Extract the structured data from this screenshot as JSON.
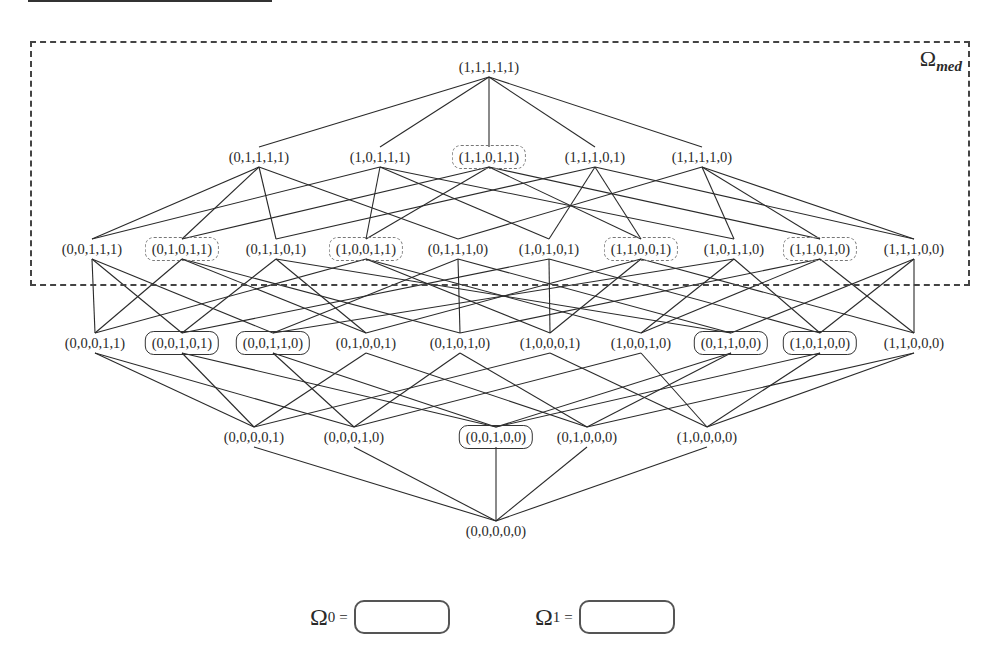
{
  "region_label": {
    "symbol": "Ω",
    "subscript": "med"
  },
  "levels": [
    {
      "y": 531,
      "nodes": [
        {
          "label": "(0,0,0,0,0)",
          "x": 496,
          "style": "plain"
        }
      ]
    },
    {
      "y": 437,
      "nodes": [
        {
          "label": "(0,0,0,0,1)",
          "x": 254,
          "style": "plain"
        },
        {
          "label": "(0,0,0,1,0)",
          "x": 354,
          "style": "plain"
        },
        {
          "label": "(0,0,1,0,0)",
          "x": 496,
          "style": "solid"
        },
        {
          "label": "(0,1,0,0,0)",
          "x": 587,
          "style": "plain"
        },
        {
          "label": "(1,0,0,0,0)",
          "x": 707,
          "style": "plain"
        }
      ]
    },
    {
      "y": 343,
      "nodes": [
        {
          "label": "(0,0,0,1,1)",
          "x": 95,
          "style": "plain"
        },
        {
          "label": "(0,0,1,0,1)",
          "x": 182,
          "style": "solid"
        },
        {
          "label": "(0,0,1,1,0)",
          "x": 273,
          "style": "solid"
        },
        {
          "label": "(0,1,0,0,1)",
          "x": 366,
          "style": "plain"
        },
        {
          "label": "(0,1,0,1,0)",
          "x": 460,
          "style": "plain"
        },
        {
          "label": "(1,0,0,0,1)",
          "x": 550,
          "style": "plain"
        },
        {
          "label": "(1,0,0,1,0)",
          "x": 641,
          "style": "plain"
        },
        {
          "label": "(0,1,1,0,0)",
          "x": 731,
          "style": "solid"
        },
        {
          "label": "(1,0,1,0,0)",
          "x": 820,
          "style": "solid"
        },
        {
          "label": "(1,1,0,0,0)",
          "x": 914,
          "style": "plain"
        }
      ]
    },
    {
      "y": 249,
      "nodes": [
        {
          "label": "(0,0,1,1,1)",
          "x": 92,
          "style": "plain"
        },
        {
          "label": "(0,1,0,1,1)",
          "x": 182,
          "style": "dotted"
        },
        {
          "label": "(0,1,1,0,1)",
          "x": 276,
          "style": "plain"
        },
        {
          "label": "(1,0,0,1,1)",
          "x": 366,
          "style": "dotted"
        },
        {
          "label": "(0,1,1,1,0)",
          "x": 458,
          "style": "plain"
        },
        {
          "label": "(1,0,1,0,1)",
          "x": 549,
          "style": "plain"
        },
        {
          "label": "(1,1,0,0,1)",
          "x": 641,
          "style": "dotted"
        },
        {
          "label": "(1,0,1,1,0)",
          "x": 734,
          "style": "plain"
        },
        {
          "label": "(1,1,0,1,0)",
          "x": 820,
          "style": "dotted"
        },
        {
          "label": "(1,1,1,0,0)",
          "x": 914,
          "style": "plain"
        }
      ]
    },
    {
      "y": 157,
      "nodes": [
        {
          "label": "(0,1,1,1,1)",
          "x": 259,
          "style": "plain"
        },
        {
          "label": "(1,0,1,1,1)",
          "x": 380,
          "style": "plain"
        },
        {
          "label": "(1,1,0,1,1)",
          "x": 489,
          "style": "dotted"
        },
        {
          "label": "(1,1,1,0,1)",
          "x": 595,
          "style": "plain"
        },
        {
          "label": "(1,1,1,1,0)",
          "x": 702,
          "style": "plain"
        }
      ]
    },
    {
      "y": 67,
      "nodes": [
        {
          "label": "(1,1,1,1,1)",
          "x": 489,
          "style": "plain"
        }
      ]
    }
  ],
  "legend": [
    {
      "symbol": "Ω",
      "subscript": "0",
      "equals": "=",
      "box_style": "solid",
      "x": 310
    },
    {
      "symbol": "Ω",
      "subscript": "1",
      "equals": "=",
      "box_style": "dotted",
      "x": 535
    }
  ],
  "colors": {
    "line": "#2a2a2a",
    "text": "#2a2a2a",
    "background": "#ffffff"
  }
}
